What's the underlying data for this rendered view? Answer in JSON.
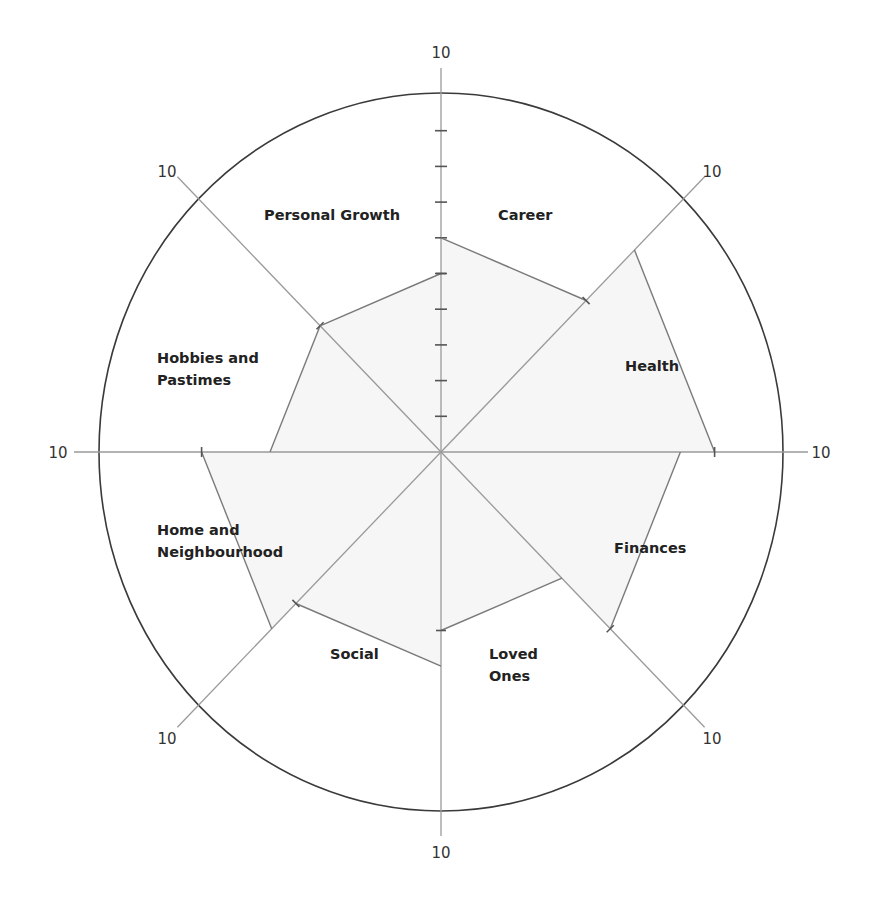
{
  "chart_data": {
    "type": "radar",
    "scale_max": 10,
    "scale_ticks": [
      1,
      2,
      3,
      4,
      5,
      6,
      7,
      8,
      9,
      10
    ],
    "axis_end_label": "10",
    "categories": [
      "Career",
      "Health",
      "Finances",
      "Loved Ones",
      "Social",
      "Home and Neighbourhood",
      "Hobbies and Pastimes",
      "Personal Growth"
    ],
    "values": [
      6,
      8,
      7,
      5,
      6,
      7,
      5,
      5
    ],
    "label_lines": [
      [
        "Career"
      ],
      [
        "Health"
      ],
      [
        "Finances"
      ],
      [
        "Loved",
        "Ones"
      ],
      [
        "Social"
      ],
      [
        "Home and",
        "Neighbourhood"
      ],
      [
        "Hobbies and",
        "Pastimes"
      ],
      [
        "Personal Growth"
      ]
    ],
    "colors": {
      "ring": "#3a3a3a",
      "axis": "#9a9a9a",
      "chord": "#7a7a7a",
      "fill": "#f6f6f6",
      "text": "#222222"
    }
  }
}
